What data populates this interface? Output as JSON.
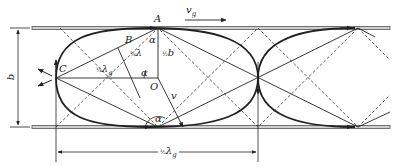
{
  "figure": {
    "type": "waveguide-ray-diagram",
    "labels": {
      "A": "A",
      "B": "B",
      "C": "C",
      "O": "O",
      "vg": "v",
      "vg_sub": "g",
      "v": "v",
      "alpha_top": "α",
      "alpha_mid": "α",
      "alpha_bottom": "α",
      "quarter_lambda_frac": "¼",
      "quarter_lambda_sym": "λ",
      "half_b_frac": "½",
      "half_b_sym": "b",
      "quarter_lambda_g_frac": "¼",
      "quarter_lambda_g_sym": "λ",
      "quarter_lambda_g_sub": "g",
      "b_dimension": "b",
      "half_lambda_g_frac": "½",
      "half_lambda_g_sym": "λ",
      "half_lambda_g_sub": "g"
    },
    "colors": {
      "line": "#222222",
      "plate": "#555555",
      "plate_fill": "#cfcfcf"
    }
  }
}
